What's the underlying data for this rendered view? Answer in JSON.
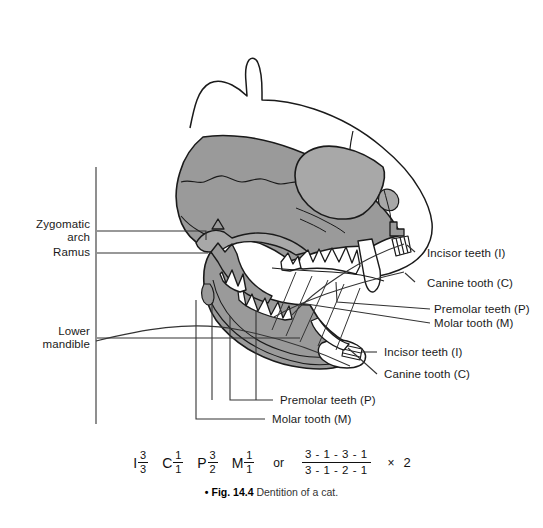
{
  "figure": {
    "caption_bullet": "•",
    "caption_tag": "Fig. 14.4",
    "caption_text": "Dentition of a cat."
  },
  "colors": {
    "bone_fill": "#9a9a9a",
    "bone_fill_light": "#a8a8a8",
    "outline": "#1a1a1a",
    "head_outline": "#1a1a1a",
    "tooth_fill": "#ffffff",
    "leader_line": "#333333",
    "background": "#ffffff"
  },
  "labels_left": [
    {
      "id": "zygomatic-arch",
      "line1": "Zygomatic",
      "line2": "arch"
    },
    {
      "id": "ramus",
      "line1": "Ramus",
      "line2": ""
    },
    {
      "id": "lower-mandible",
      "line1": "Lower",
      "line2": "mandible"
    }
  ],
  "labels_right_upper": [
    {
      "id": "incisor-upper",
      "text": "Incisor teeth (I)"
    },
    {
      "id": "canine-upper",
      "text": "Canine tooth (C)"
    },
    {
      "id": "premolar-upper",
      "text": "Premolar teeth (P)"
    },
    {
      "id": "molar-upper",
      "text": "Molar tooth (M)"
    }
  ],
  "labels_right_lower": [
    {
      "id": "incisor-lower",
      "text": "Incisor teeth (I)"
    },
    {
      "id": "canine-lower",
      "text": "Canine tooth (C)"
    },
    {
      "id": "premolar-lower",
      "text": "Premolar teeth (P)"
    },
    {
      "id": "molar-lower",
      "text": "Molar tooth (M)"
    }
  ],
  "dental_formula": {
    "compact": [
      {
        "letter": "I",
        "upper": "3",
        "lower": "3"
      },
      {
        "letter": "C",
        "upper": "1",
        "lower": "1"
      },
      {
        "letter": "P",
        "upper": "3",
        "lower": "2"
      },
      {
        "letter": "M",
        "upper": "1",
        "lower": "1"
      }
    ],
    "or_word": "or",
    "expanded": {
      "numerator": "3 - 1 - 3 - 1",
      "denominator": "3 - 1 - 2 - 1"
    },
    "multiplier_symbol": "×",
    "multiplier_value": "2"
  }
}
